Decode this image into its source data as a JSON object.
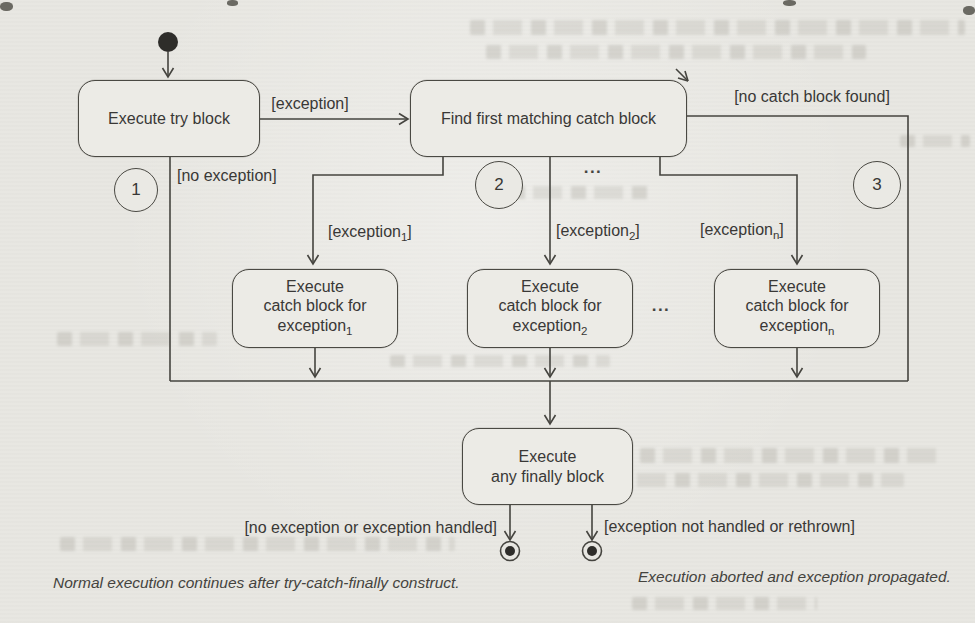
{
  "page": {
    "type": "scanned book page with UML state diagram of try-catch-finally execution",
    "colors": {
      "paper": "#e8e7e2",
      "ink": "#45443f",
      "text": "#393836"
    }
  },
  "diagram": {
    "states": {
      "try_block": {
        "label": "Execute try block"
      },
      "find_catch": {
        "label": "Find first matching catch block"
      },
      "catch1": {
        "line1": "Execute",
        "line2": "catch block for",
        "base": "exception",
        "sub": "1"
      },
      "catch2": {
        "line1": "Execute",
        "line2": "catch block for",
        "base": "exception",
        "sub": "2"
      },
      "catchn": {
        "line1": "Execute",
        "line2": "catch block for",
        "base": "exception",
        "sub": "n"
      },
      "finally": {
        "line1": "Execute",
        "line2": "any finally block"
      }
    },
    "transitions": {
      "exception": {
        "label": "[exception]"
      },
      "no_exception": {
        "label": "[no exception]"
      },
      "no_catch": {
        "label": "[no catch block found]"
      },
      "exception1": {
        "pre": "[exception",
        "sub": "1",
        "post": "]"
      },
      "exception2": {
        "pre": "[exception",
        "sub": "2",
        "post": "]"
      },
      "exceptionn": {
        "pre": "[exception",
        "sub": "n",
        "post": "]"
      },
      "handled": {
        "label": "[no exception or exception handled]"
      },
      "not_handled": {
        "label": "[exception not handled or rethrown]"
      }
    },
    "annotations": {
      "marker1": "1",
      "marker2": "2",
      "marker3": "3",
      "ellipsis_branches": "...",
      "ellipsis_blocks": "...",
      "caption_normal": "Normal execution continues after try-catch-finally construct.",
      "caption_abort": "Execution aborted and exception propagated."
    }
  }
}
